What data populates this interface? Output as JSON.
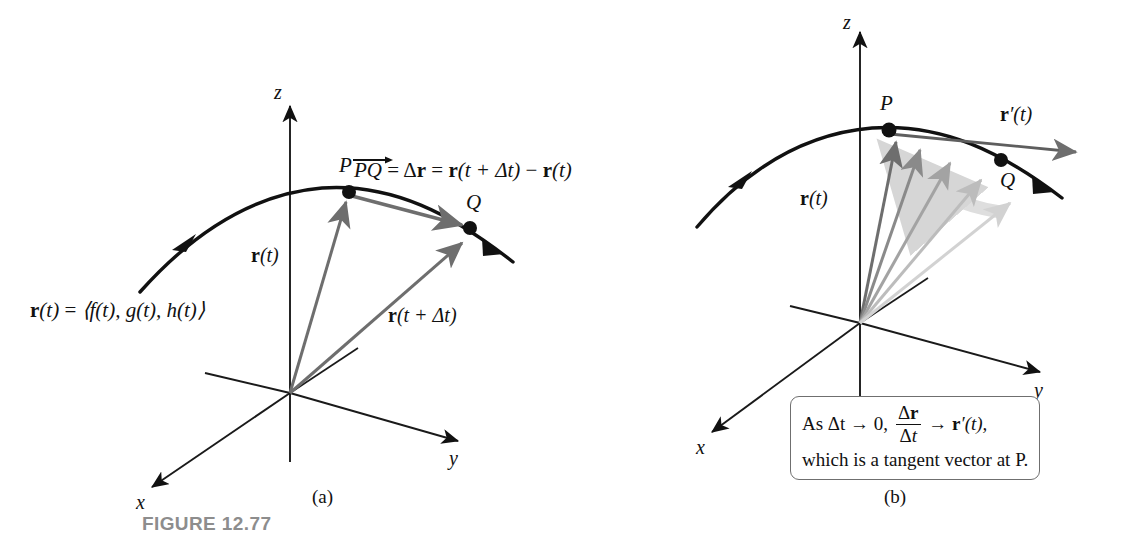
{
  "figure": {
    "caption": "FIGURE 12.77",
    "caption_color": "#8d8d8d",
    "background": "#ffffff",
    "curve_color": "#111111",
    "vector_color": "#6e6e6e",
    "axis_color": "#1a1a1a"
  },
  "panel_a": {
    "sublabel": "(a)",
    "axes": {
      "z": "z",
      "y": "y",
      "x": "x"
    },
    "points": {
      "p": "P",
      "q": "Q"
    },
    "vectors": {
      "r_t": {
        "bold": "r",
        "arg": "(t)"
      },
      "r_t_dt": {
        "bold": "r",
        "arg": "(t + Δt)"
      }
    },
    "equation": {
      "pq": "PQ",
      "eq1": "=",
      "delta_r_delta": "Δ",
      "delta_r_bold": "r",
      "eq2": "=",
      "term1_bold": "r",
      "term1_arg": "(t + Δt)",
      "minus": "−",
      "term2_bold": "r",
      "term2_arg": "(t)"
    },
    "definition": {
      "lhs_bold": "r",
      "lhs_arg": "(t)",
      "eq": "=",
      "rhs": "⟨f(t), g(t), h(t)⟩"
    }
  },
  "panel_b": {
    "sublabel": "(b)",
    "axes": {
      "z": "z",
      "y": "y",
      "x": "x"
    },
    "points": {
      "p": "P",
      "q": "Q"
    },
    "vectors": {
      "r_t": {
        "bold": "r",
        "arg": "(t)"
      },
      "r_prime": {
        "bold": "r",
        "arg": "′(t)"
      }
    },
    "annotation": {
      "line1_pre": "As Δt → 0,",
      "frac_num_delta": "Δ",
      "frac_num_bold": "r",
      "frac_den_delta": "Δ",
      "frac_den_t": "t",
      "line1_arrow": "→",
      "line1_bold": "r",
      "line1_post": "′(t),",
      "line2": "which is a tangent vector at P."
    },
    "secant_count": 5
  }
}
